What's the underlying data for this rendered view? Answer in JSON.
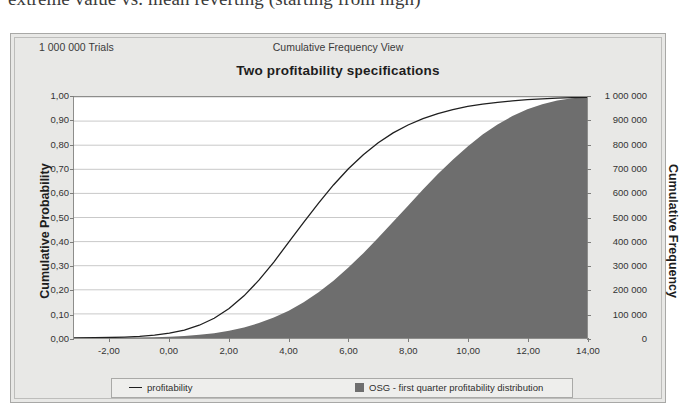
{
  "page": {
    "heading": "extreme value vs. mean reverting (starting from high)"
  },
  "card": {
    "header": {
      "trials": "1 000 000 Trials",
      "view": "Cumulative Frequency View"
    },
    "title": "Two profitability specifications"
  },
  "legend": {
    "entries": [
      {
        "label": "profitability",
        "marker": "line",
        "color": "#1f1f1f"
      },
      {
        "label": "OSG - first quarter profitability distribution",
        "marker": "swatch",
        "color": "#6e6e6e"
      }
    ]
  },
  "colors": {
    "card_background": "#e8e8e6",
    "plot_background": "#ffffff",
    "gridline": "#c9c9c9",
    "frame": "#8d8d8b",
    "line_series": "#1f1f1f",
    "area_series": "#6e6e6e"
  },
  "chart_data": {
    "type": "line",
    "title": "Two profitability specifications",
    "subtitle": "Cumulative Frequency View",
    "xlabel": "",
    "ylabel": "Cumulative Probability",
    "y2label": "Cumulative Frequency",
    "xlim": [
      -3.2,
      14.0
    ],
    "ylim": [
      0.0,
      1.0
    ],
    "y2lim": [
      0,
      1000000
    ],
    "grid": true,
    "grid_axis": "y",
    "legend_position": "bottom",
    "xticks": [
      "-2,00",
      "0,00",
      "2,00",
      "4,00",
      "6,00",
      "8,00",
      "10,00",
      "12,00",
      "14,00"
    ],
    "xtick_values": [
      -2,
      0,
      2,
      4,
      6,
      8,
      10,
      12,
      14
    ],
    "yticks": [
      "0,00",
      "0,10",
      "0,20",
      "0,30",
      "0,40",
      "0,50",
      "0,60",
      "0,70",
      "0,80",
      "0,90",
      "1,00"
    ],
    "ytick_values": [
      0.0,
      0.1,
      0.2,
      0.3,
      0.4,
      0.5,
      0.6,
      0.7,
      0.8,
      0.9,
      1.0
    ],
    "y2ticks": [
      "0",
      "100 000",
      "200 000",
      "300 000",
      "400 000",
      "500 000",
      "600 000",
      "700 000",
      "800 000",
      "900 000",
      "1 000 000"
    ],
    "y2tick_values": [
      0,
      100000,
      200000,
      300000,
      400000,
      500000,
      600000,
      700000,
      800000,
      900000,
      1000000
    ],
    "x": [
      -3.2,
      -2.5,
      -2.0,
      -1.5,
      -1.0,
      -0.5,
      0.0,
      0.5,
      1.0,
      1.5,
      2.0,
      2.5,
      3.0,
      3.5,
      4.0,
      4.5,
      5.0,
      5.5,
      6.0,
      6.5,
      7.0,
      7.5,
      8.0,
      8.5,
      9.0,
      9.5,
      10.0,
      10.5,
      11.0,
      11.5,
      12.0,
      12.5,
      13.0,
      13.5,
      14.0
    ],
    "series": [
      {
        "name": "profitability",
        "type": "line",
        "color": "#1f1f1f",
        "values": [
          0.0,
          0.001,
          0.002,
          0.004,
          0.007,
          0.012,
          0.02,
          0.033,
          0.053,
          0.082,
          0.122,
          0.175,
          0.24,
          0.315,
          0.398,
          0.48,
          0.56,
          0.635,
          0.702,
          0.76,
          0.81,
          0.851,
          0.884,
          0.91,
          0.931,
          0.948,
          0.961,
          0.97,
          0.978,
          0.984,
          0.989,
          0.992,
          0.995,
          0.997,
          0.999
        ]
      },
      {
        "name": "OSG - first quarter profitability distribution",
        "type": "area",
        "color": "#6e6e6e",
        "values": [
          0.0,
          0.0,
          0.001,
          0.001,
          0.002,
          0.003,
          0.005,
          0.008,
          0.013,
          0.02,
          0.03,
          0.044,
          0.062,
          0.085,
          0.113,
          0.148,
          0.19,
          0.238,
          0.292,
          0.352,
          0.416,
          0.482,
          0.549,
          0.616,
          0.68,
          0.74,
          0.795,
          0.844,
          0.886,
          0.921,
          0.949,
          0.97,
          0.985,
          0.995,
          1.0
        ]
      }
    ]
  }
}
